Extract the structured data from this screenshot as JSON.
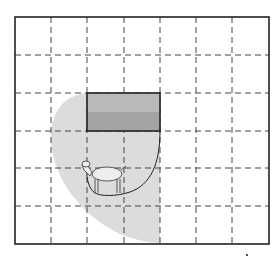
{
  "diagram": {
    "grid": {
      "columns": 7,
      "rows": 6,
      "line_style": "dashed",
      "line_color": "#444444"
    },
    "shed": {
      "label": "shed",
      "fill_top": "#b9b9b9",
      "fill_bottom": "#a3a3a3",
      "stroke": "#222222"
    },
    "grazing_region": {
      "label": "grazing area",
      "fill": "#dcdcdc"
    },
    "rope": {
      "label": "rope",
      "color": "#222222"
    },
    "goat": {
      "label": "goat"
    }
  }
}
